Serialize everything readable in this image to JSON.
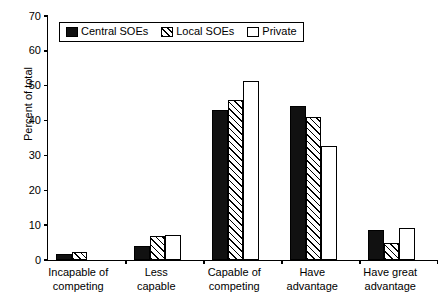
{
  "chart_data": {
    "type": "bar",
    "title": "",
    "xlabel": "",
    "ylabel": "Percent of total",
    "ylim": [
      0,
      70
    ],
    "ytick_step": 10,
    "yticks": [
      0,
      10,
      20,
      30,
      40,
      50,
      60,
      70
    ],
    "grid": false,
    "legend_position": "top-left inside plot",
    "categories": [
      "Incapable of\ncompeting",
      "Less\ncapable",
      "Capable of\ncompeting",
      "Have\nadvantage",
      "Have great\nadvantage"
    ],
    "series": [
      {
        "name": "Central SOEs",
        "style": "solid-black",
        "values": [
          1.7,
          4.0,
          43.0,
          44.2,
          8.7
        ]
      },
      {
        "name": "Local SOEs",
        "style": "diagonal-hatch",
        "values": [
          2.2,
          6.9,
          46.0,
          41.0,
          5.0
        ]
      },
      {
        "name": "Private",
        "style": "white-open",
        "values": [
          0,
          7.2,
          51.5,
          32.8,
          9.1
        ]
      }
    ]
  }
}
